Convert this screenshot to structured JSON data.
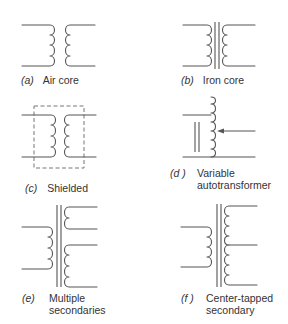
{
  "figure": {
    "panels": [
      {
        "id": "a",
        "tag_open": "(",
        "tag_letter": "a",
        "tag_close": ")",
        "caption_line1": "Air core",
        "caption_line2": ""
      },
      {
        "id": "b",
        "tag_open": "(",
        "tag_letter": "b",
        "tag_close": ")",
        "caption_line1": "Iron core",
        "caption_line2": ""
      },
      {
        "id": "c",
        "tag_open": "(",
        "tag_letter": "c",
        "tag_close": ")",
        "caption_line1": "Shielded",
        "caption_line2": ""
      },
      {
        "id": "d",
        "tag_open": "(",
        "tag_letter": "d",
        "tag_close": " )",
        "caption_line1": "Variable",
        "caption_line2": "autotransformer"
      },
      {
        "id": "e",
        "tag_open": "(",
        "tag_letter": "e",
        "tag_close": ")",
        "caption_line1": "Multiple",
        "caption_line2": "secondaries"
      },
      {
        "id": "f",
        "tag_open": "(",
        "tag_letter": "f",
        "tag_close": " )",
        "caption_line1": "Center-tapped",
        "caption_line2": "secondary"
      }
    ]
  },
  "colors": {
    "line": "#555555",
    "text": "#333333",
    "background": "#ffffff"
  }
}
